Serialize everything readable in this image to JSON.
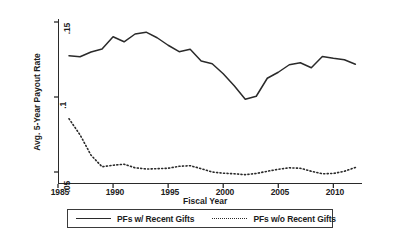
{
  "chart_data": {
    "type": "line",
    "title": "",
    "xlabel": "Fiscal Year",
    "ylabel": "Avg. 5-Year Payout Rate",
    "xlim": [
      1985,
      2012.6
    ],
    "ylim": [
      0.042,
      0.152
    ],
    "xticks": [
      "1985",
      "1990",
      "1995",
      "2000",
      "2005",
      "2010"
    ],
    "xtick_values": [
      1985,
      1990,
      1995,
      2000,
      2005,
      2010
    ],
    "yticks": [
      ".05",
      ".1",
      ".15"
    ],
    "ytick_values": [
      0.05,
      0.1,
      0.15
    ],
    "grid": false,
    "legend_position": "below-center",
    "x": [
      1986,
      1987,
      1988,
      1989,
      1990,
      1991,
      1992,
      1993,
      1994,
      1995,
      1996,
      1997,
      1998,
      1999,
      2000,
      2001,
      2002,
      2003,
      2004,
      2005,
      2006,
      2007,
      2008,
      2009,
      2010,
      2011,
      2012
    ],
    "series": [
      {
        "name": "PFs w/ Recent Gifts",
        "style": "solid",
        "color": "#2a2a2a",
        "values": [
          0.1275,
          0.1268,
          0.13,
          0.132,
          0.1402,
          0.1368,
          0.142,
          0.1432,
          0.1395,
          0.1345,
          0.1302,
          0.1318,
          0.124,
          0.1222,
          0.1155,
          0.1075,
          0.0985,
          0.1005,
          0.1125,
          0.1165,
          0.1215,
          0.1228,
          0.1195,
          0.127,
          0.1258,
          0.1248,
          0.1218
        ]
      },
      {
        "name": "PFs w/o Recent Gifts",
        "style": "dotted",
        "color": "#2a2a2a",
        "values": [
          0.0855,
          0.0748,
          0.0612,
          0.0535,
          0.0545,
          0.0552,
          0.0528,
          0.052,
          0.0522,
          0.0525,
          0.0538,
          0.0542,
          0.0522,
          0.05,
          0.0492,
          0.0488,
          0.0482,
          0.049,
          0.0505,
          0.0518,
          0.0528,
          0.0525,
          0.0505,
          0.0488,
          0.049,
          0.0505,
          0.053
        ]
      }
    ]
  },
  "axis": {
    "ylabel": "Avg. 5-Year Payout Rate",
    "xlabel": "Fiscal Year",
    "ytick_0": ".05",
    "ytick_1": ".1",
    "ytick_2": ".15",
    "xtick_0": "1985",
    "xtick_1": "1990",
    "xtick_2": "1995",
    "xtick_3": "2000",
    "xtick_4": "2005",
    "xtick_5": "2010"
  },
  "legend": {
    "entry_solid": "PFs w/ Recent Gifts",
    "entry_dotted": "PFs w/o Recent Gifts"
  }
}
